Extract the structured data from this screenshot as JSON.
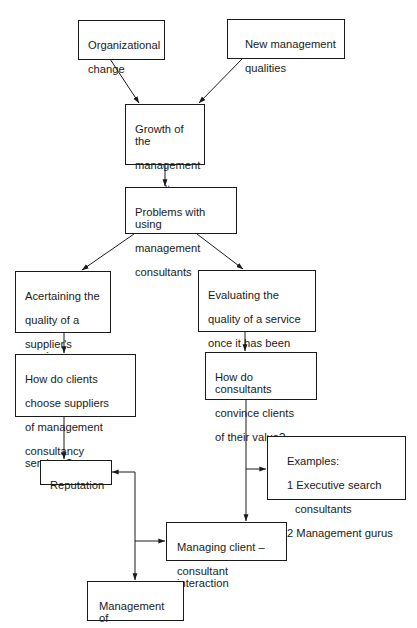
{
  "diagram": {
    "type": "flowchart",
    "colors": {
      "line": "#1a1a1a",
      "background": "#ffffff",
      "text": "#1a1a1a"
    },
    "nodes": {
      "org_change": {
        "lines": [
          "Organizational",
          "change"
        ]
      },
      "new_mgmt": {
        "lines": [
          "New management",
          "qualities"
        ]
      },
      "growth": {
        "lines": [
          "Growth of the",
          "management",
          "consultancy",
          "industry"
        ]
      },
      "problems": {
        "lines": [
          "Problems with using",
          "management",
          "consultants"
        ]
      },
      "acertaining": {
        "lines": [
          "Acertaining the",
          "quality of a",
          "supplier's service",
          "prior to purchase"
        ]
      },
      "evaluating": {
        "lines": [
          "Evaluating the",
          "quality of a service",
          "once it has been",
          "delivered"
        ]
      },
      "how_clients": {
        "lines": [
          "How do clients",
          "choose suppliers",
          "of management",
          "consultancy services?"
        ]
      },
      "how_consultants": {
        "lines": [
          "How do consultants",
          "convince clients",
          "of their value?"
        ]
      },
      "examples": {
        "lines": [
          "Examples:",
          "1 Executive search",
          "consultants",
          "2 Management gurus"
        ]
      },
      "reputation": {
        "lines": [
          "Reputation"
        ]
      },
      "managing": {
        "lines": [
          "Managing client –",
          "consultant interaction"
        ]
      },
      "impressions": {
        "lines": [
          "Management of",
          "impressions"
        ]
      }
    },
    "edges": [
      {
        "from": "Organizational change",
        "to": "Growth of the management consultancy industry"
      },
      {
        "from": "New management qualities",
        "to": "Growth of the management consultancy industry"
      },
      {
        "from": "Growth of the management consultancy industry",
        "to": "Problems with using management consultants"
      },
      {
        "from": "Problems with using management consultants",
        "to": "Acertaining the quality of a supplier's service prior to purchase"
      },
      {
        "from": "Problems with using management consultants",
        "to": "Evaluating the quality of a service once it has been delivered"
      },
      {
        "from": "Acertaining the quality of a supplier's service prior to purchase",
        "to": "How do clients choose suppliers of management consultancy services?"
      },
      {
        "from": "Evaluating the quality of a service once it has been delivered",
        "to": "How do consultants convince clients of their value?"
      },
      {
        "from": "How do clients choose suppliers of management consultancy services?",
        "to": "Reputation"
      },
      {
        "from": "How do consultants convince clients of their value?",
        "to": "Examples"
      },
      {
        "from": "How do consultants convince clients of their value?",
        "to": "Managing client – consultant interaction"
      },
      {
        "from": "Management of impressions trunk",
        "to": "Reputation"
      },
      {
        "from": "Management of impressions trunk",
        "to": "Managing client – consultant interaction"
      },
      {
        "from": "Management of impressions trunk",
        "to": "Management of impressions"
      }
    ]
  }
}
